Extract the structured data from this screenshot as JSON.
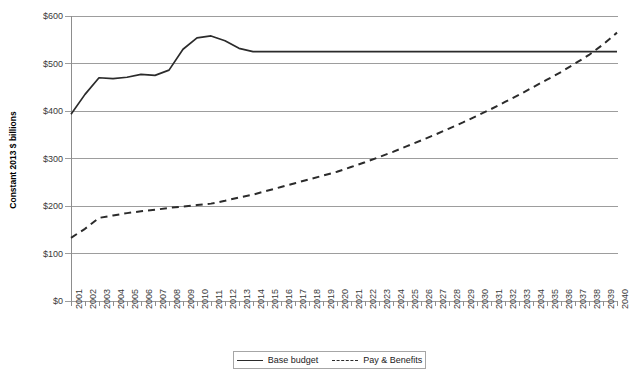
{
  "chart_data": {
    "type": "line",
    "title": "",
    "xlabel": "",
    "ylabel": "Constant 2013 $ billions",
    "x": [
      2001,
      2002,
      2003,
      2004,
      2005,
      2006,
      2007,
      2008,
      2009,
      2010,
      2011,
      2012,
      2013,
      2014,
      2015,
      2016,
      2017,
      2018,
      2019,
      2020,
      2021,
      2022,
      2023,
      2024,
      2025,
      2026,
      2027,
      2028,
      2029,
      2030,
      2031,
      2032,
      2033,
      2034,
      2035,
      2036,
      2037,
      2038,
      2039,
      2040
    ],
    "xtick_labels": [
      "2001",
      "2002",
      "2003",
      "2004",
      "2005",
      "2006",
      "2007",
      "2008",
      "2009",
      "2010",
      "2011",
      "2012",
      "2013",
      "2014",
      "2015",
      "2016",
      "2017",
      "2018",
      "2019",
      "2020",
      "2021",
      "2022",
      "2023",
      "2024",
      "2025",
      "2026",
      "2027",
      "2028",
      "2029",
      "2030",
      "2031",
      "2032",
      "2033",
      "2034",
      "2035",
      "2036",
      "2037",
      "2038",
      "2039",
      "2040"
    ],
    "ytick_labels": [
      "$0",
      "$100",
      "$200",
      "$300",
      "$400",
      "$500",
      "$600"
    ],
    "ytick_values": [
      0,
      100,
      200,
      300,
      400,
      500,
      600
    ],
    "ylim": [
      0,
      600
    ],
    "xlim": [
      2001,
      2040
    ],
    "grid": true,
    "legend_position": "bottom-center",
    "series": [
      {
        "name": "Base budget",
        "style": "solid",
        "color": "#2b2b2b",
        "values": [
          393,
          435,
          470,
          468,
          471,
          477,
          475,
          486,
          530,
          554,
          558,
          548,
          532,
          525,
          525,
          525,
          525,
          525,
          525,
          525,
          525,
          525,
          525,
          525,
          525,
          525,
          525,
          525,
          525,
          525,
          525,
          525,
          525,
          525,
          525,
          525,
          525,
          525,
          525,
          525
        ]
      },
      {
        "name": "Pay & Benefits",
        "style": "dashed",
        "color": "#2b2b2b",
        "values": [
          133,
          152,
          175,
          180,
          185,
          189,
          192,
          196,
          199,
          202,
          205,
          211,
          218,
          224,
          232,
          240,
          248,
          256,
          264,
          272,
          282,
          292,
          303,
          314,
          326,
          338,
          350,
          363,
          376,
          390,
          404,
          419,
          434,
          450,
          466,
          482,
          500,
          518,
          540,
          565
        ]
      }
    ]
  },
  "legend": {
    "items": [
      {
        "label": "Base budget",
        "style": "solid"
      },
      {
        "label": "Pay & Benefits",
        "style": "dashed"
      }
    ]
  }
}
